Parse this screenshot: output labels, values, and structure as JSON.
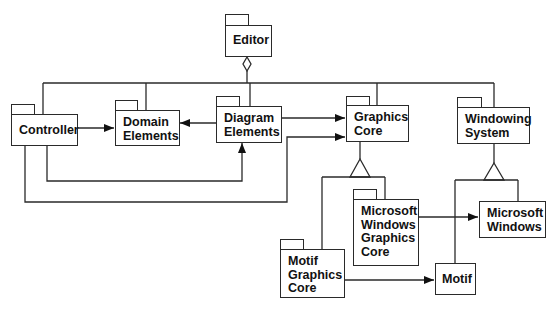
{
  "diagram": {
    "type": "UML package diagram",
    "packages": [
      {
        "id": "editor",
        "label": "Editor"
      },
      {
        "id": "controller",
        "label": "Controller"
      },
      {
        "id": "domain_elements",
        "label": "Domain\nElements"
      },
      {
        "id": "diagram_elements",
        "label": "Diagram\nElements"
      },
      {
        "id": "graphics_core",
        "label": "Graphics\nCore"
      },
      {
        "id": "windowing_system",
        "label": "Windowing\nSystem"
      },
      {
        "id": "ms_windows_graphics_core",
        "label": "Microsoft\nWindows\nGraphics\nCore"
      },
      {
        "id": "ms_windows",
        "label": "Microsoft\nWindows"
      },
      {
        "id": "motif_graphics_core",
        "label": "Motif\nGraphics\nCore"
      },
      {
        "id": "motif",
        "label": "Motif"
      }
    ],
    "relationships": [
      {
        "from": "editor",
        "to": [
          "controller",
          "domain_elements",
          "diagram_elements",
          "graphics_core",
          "windowing_system"
        ],
        "kind": "aggregation"
      },
      {
        "from": "controller",
        "to": "domain_elements",
        "kind": "dependency"
      },
      {
        "from": "controller",
        "to": "diagram_elements",
        "kind": "dependency"
      },
      {
        "from": "controller",
        "to": "graphics_core",
        "kind": "dependency"
      },
      {
        "from": "diagram_elements",
        "to": "domain_elements",
        "kind": "dependency"
      },
      {
        "from": "diagram_elements",
        "to": "graphics_core",
        "kind": "dependency"
      },
      {
        "from": "ms_windows_graphics_core",
        "to": "graphics_core",
        "kind": "generalization"
      },
      {
        "from": "motif_graphics_core",
        "to": "graphics_core",
        "kind": "generalization"
      },
      {
        "from": "ms_windows",
        "to": "windowing_system",
        "kind": "generalization"
      },
      {
        "from": "motif",
        "to": "windowing_system",
        "kind": "generalization"
      },
      {
        "from": "ms_windows_graphics_core",
        "to": "ms_windows",
        "kind": "dependency"
      },
      {
        "from": "motif_graphics_core",
        "to": "motif",
        "kind": "dependency"
      }
    ]
  },
  "colors": {
    "line": "#2a2a2a",
    "background": "#ffffff"
  }
}
